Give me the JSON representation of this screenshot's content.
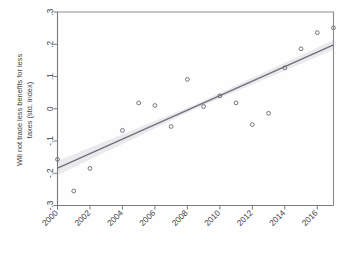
{
  "chart_data": {
    "type": "scatter",
    "title": "",
    "subtitle": "",
    "xlabel": "",
    "ylabel": "Will not trade less benefits for less taxes (std. index)",
    "ylabel_line1": "Will not trade less benefits for less",
    "ylabel_line2": "taxes (std. index)",
    "xlim": [
      2000,
      2017
    ],
    "ylim": [
      -0.3,
      0.3
    ],
    "xticks": [
      2000,
      2002,
      2004,
      2006,
      2008,
      2010,
      2012,
      2014,
      2016
    ],
    "xtick_labels": [
      "2000",
      "2002",
      "2004",
      "2006",
      "2008",
      "2010",
      "2012",
      "2014",
      "2016"
    ],
    "yticks": [
      -0.3,
      -0.2,
      -0.1,
      0,
      0.1,
      0.2,
      0.3
    ],
    "ytick_labels": [
      "-.3",
      "-.2",
      "-.1",
      "0",
      ".1",
      ".2",
      ".3"
    ],
    "grid": false,
    "legend": null,
    "x": [
      2000,
      2001,
      2002,
      2004,
      2005,
      2006,
      2007,
      2008,
      2009,
      2010,
      2011,
      2012,
      2013,
      2014,
      2015,
      2016,
      2017
    ],
    "y": [
      -0.157,
      -0.255,
      -0.185,
      -0.067,
      0.018,
      0.01,
      -0.055,
      0.091,
      0.007,
      0.04,
      0.018,
      -0.049,
      -0.014,
      0.127,
      0.186,
      0.236,
      0.251
    ],
    "series": [
      {
        "name": "Will not trade less benefits for less taxes (std. index)",
        "type": "scatter",
        "marker": "open-circle",
        "color": "#6a6a74",
        "points": [
          {
            "x": 2000,
            "y": -0.157
          },
          {
            "x": 2001,
            "y": -0.255
          },
          {
            "x": 2002,
            "y": -0.185
          },
          {
            "x": 2004,
            "y": -0.067
          },
          {
            "x": 2005,
            "y": 0.018
          },
          {
            "x": 2006,
            "y": 0.01
          },
          {
            "x": 2007,
            "y": -0.055
          },
          {
            "x": 2008,
            "y": 0.091
          },
          {
            "x": 2009,
            "y": 0.007
          },
          {
            "x": 2010,
            "y": 0.04
          },
          {
            "x": 2011,
            "y": 0.018
          },
          {
            "x": 2012,
            "y": -0.049
          },
          {
            "x": 2013,
            "y": -0.014
          },
          {
            "x": 2014,
            "y": 0.127
          },
          {
            "x": 2015,
            "y": 0.186
          },
          {
            "x": 2016,
            "y": 0.236
          },
          {
            "x": 2017,
            "y": 0.251
          }
        ]
      },
      {
        "name": "linear fit",
        "type": "line",
        "color": "#6e6e78",
        "endpoints": [
          {
            "x": 2000,
            "y": -0.184
          },
          {
            "x": 2017,
            "y": 0.198
          }
        ],
        "confidence_band": {
          "fill": "#bdbdc6",
          "opacity": 0.3,
          "lower": [
            {
              "x": 2000,
              "y": -0.206
            },
            {
              "x": 2008.5,
              "y": 0.0
            },
            {
              "x": 2017,
              "y": 0.183
            }
          ],
          "upper": [
            {
              "x": 2000,
              "y": -0.162
            },
            {
              "x": 2008.5,
              "y": 0.014
            },
            {
              "x": 2017,
              "y": 0.213
            }
          ]
        }
      }
    ],
    "colors": {
      "marker": "#6a6a74",
      "fit_line": "#6e6e78",
      "ci_band": "#bdbdc6",
      "frame": "#7a7a7a",
      "text": "#3f3f3f",
      "background": "#fefefe"
    }
  }
}
